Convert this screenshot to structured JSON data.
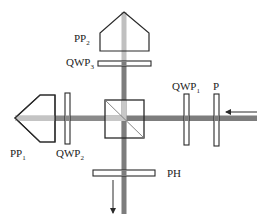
{
  "diagram": {
    "type": "optical-setup",
    "colors": {
      "outline": "#2a2a2a",
      "beam_dark": "#7d7d7d",
      "beam_light": "#c4c4c4",
      "background": "#ffffff"
    },
    "labels": {
      "pp2": {
        "main": "PP",
        "sub": "2"
      },
      "qwp3": {
        "main": "QWP",
        "sub": "3"
      },
      "qwp1": {
        "main": "QWP",
        "sub": "1"
      },
      "p": {
        "main": "P"
      },
      "pp1": {
        "main": "PP",
        "sub": "1"
      },
      "qwp2": {
        "main": "QWP",
        "sub": "2"
      },
      "ph": {
        "main": "PH"
      }
    },
    "components": [
      {
        "id": "PP2",
        "kind": "prism"
      },
      {
        "id": "QWP3",
        "kind": "quarter-wave-plate"
      },
      {
        "id": "cube",
        "kind": "beam-splitter"
      },
      {
        "id": "PP1",
        "kind": "prism"
      },
      {
        "id": "QWP2",
        "kind": "quarter-wave-plate"
      },
      {
        "id": "QWP1",
        "kind": "quarter-wave-plate"
      },
      {
        "id": "P",
        "kind": "polarizer"
      },
      {
        "id": "PH",
        "kind": "plate"
      }
    ],
    "arrows": [
      {
        "id": "input-arrow",
        "direction": "left"
      },
      {
        "id": "output-arrow",
        "direction": "down"
      }
    ]
  }
}
